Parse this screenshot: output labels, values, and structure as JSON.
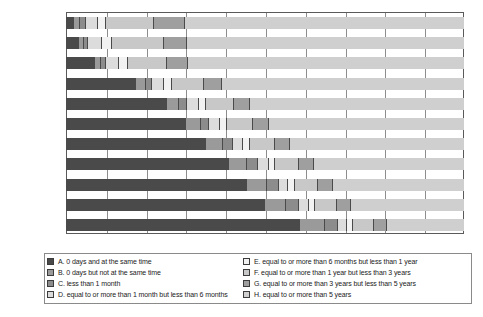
{
  "chart_data": {
    "type": "bar",
    "orientation": "horizontal",
    "stacked": true,
    "normalized_percent": true,
    "title": "",
    "xlabel": "",
    "ylabel": "",
    "xlim": [
      0,
      100
    ],
    "grid": true,
    "legend_position": "bottom",
    "xticks": [
      "0%",
      "10%",
      "20%",
      "30%",
      "40%",
      "50%",
      "60%",
      "70%",
      "80%",
      "90%",
      "100%"
    ],
    "xtick_values": [
      0,
      10,
      20,
      30,
      40,
      50,
      60,
      70,
      80,
      90,
      100
    ],
    "categories": [
      "2001-2002",
      "2003-2004",
      "2005-2006",
      "2007-2008",
      "2009-2010",
      "2011-2012",
      "2013-2014",
      "2015-2016",
      "2017-2018",
      "2019-2020",
      "2021"
    ],
    "category_counts": [
      "(n=14,951)",
      "(n=34,633)",
      "(n=53,211)",
      "(n=52,395)",
      "(n=30,439)",
      "(n=23,954)",
      "(n=22,920)",
      "(n=21,677)",
      "(n=28,222)",
      "(n=22,161)",
      "(n=8,687)"
    ],
    "series": [
      {
        "name": "A",
        "label": "A. 0 days and at the same time",
        "color": "#4a4a4a",
        "values": [
          2.0,
          3.2,
          7.3,
          17.7,
          25.3,
          30.1,
          35.2,
          40.9,
          45.4,
          50.0,
          58.9
        ]
      },
      {
        "name": "B",
        "label": "B. 0 days but not at the same time",
        "color": "#9a9a9a",
        "values": [
          1.6,
          1.2,
          1.4,
          2.3,
          3.2,
          3.7,
          4.2,
          4.6,
          5.0,
          5.4,
          6.1
        ]
      },
      {
        "name": "C",
        "label": "C. less than 1 month",
        "color": "#8c8c8c",
        "values": [
          1.4,
          1.1,
          1.3,
          1.7,
          2.0,
          2.2,
          2.5,
          2.8,
          3.0,
          3.2,
          3.4
        ]
      },
      {
        "name": "D",
        "label": "D. equal to or more than 1 month but less than 6 months",
        "color": "#dcdcdc",
        "values": [
          3.0,
          3.6,
          3.3,
          3.0,
          2.8,
          2.7,
          2.6,
          2.6,
          2.5,
          2.4,
          2.3
        ]
      },
      {
        "name": "E",
        "label": "E. equal to or more than 6 months but less than 1 year",
        "color": "#f2f2f2",
        "values": [
          2.0,
          2.4,
          2.2,
          2.0,
          1.9,
          1.8,
          1.8,
          1.7,
          1.7,
          1.6,
          1.5
        ]
      },
      {
        "name": "F",
        "label": "F. equal to or more than 1 year but less than 3 years",
        "color": "#c8c8c8",
        "values": [
          12.0,
          13.0,
          9.8,
          8.0,
          7.0,
          6.5,
          6.2,
          6.0,
          5.8,
          5.5,
          5.2
        ]
      },
      {
        "name": "G",
        "label": "G. equal to or more than 3 years but less than 5 years",
        "color": "#9f9f9f",
        "values": [
          8.0,
          6.0,
          5.3,
          4.5,
          4.1,
          3.9,
          3.8,
          3.7,
          3.6,
          3.5,
          3.3
        ]
      },
      {
        "name": "H",
        "label": "H. equal to or more than 5 years",
        "color": "#cfcfcf",
        "values": [
          70.0,
          69.5,
          69.4,
          60.8,
          53.7,
          49.1,
          43.7,
          37.7,
          33.0,
          28.4,
          19.3
        ]
      }
    ]
  },
  "legend": {
    "left_column": [
      "A. 0 days and at the same time",
      "B. 0 days but not at the same time",
      "C. less than 1 month",
      "D. equal to or more than 1 month but less than 6 months"
    ],
    "right_column": [
      "E. equal to or more than 6 months but less than 1 year",
      "F. equal to or more than 1 year but less than 3 years",
      "G. equal to or more than 3 years but less than 5 years",
      "H. equal to or more than 5 years"
    ]
  }
}
